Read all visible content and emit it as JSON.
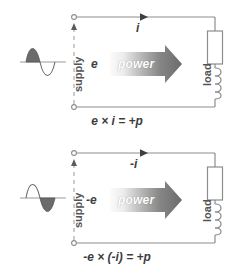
{
  "figure": {
    "background_color": "#ffffff",
    "wire_color": "#8d8d8d",
    "text_color": "#4a4a4a",
    "arrow_dark": "#6e6e6e",
    "arrow_light": "#f2f2f2",
    "waveform_fill": "#6b6b6b"
  },
  "circuits": [
    {
      "id": "top",
      "waveform": {
        "name": "sine-wave-positive-half-shaded",
        "shaded_half": "positive"
      },
      "supply_label": "supply",
      "load_label": "load",
      "voltage_label": "e",
      "current_label": "i",
      "power_label": "power",
      "equation": "e × i = +p",
      "voltage_arrow_direction": "up",
      "current_arrow_direction": "right",
      "power_arrow_direction": "right"
    },
    {
      "id": "bottom",
      "waveform": {
        "name": "sine-wave-negative-half-shaded",
        "shaded_half": "negative"
      },
      "supply_label": "supply",
      "load_label": "load",
      "voltage_label": "-e",
      "current_label": "-i",
      "power_label": "power",
      "equation": "-e × (-i) = +p",
      "voltage_arrow_direction": "up",
      "current_arrow_direction": "right",
      "power_arrow_direction": "right"
    }
  ]
}
